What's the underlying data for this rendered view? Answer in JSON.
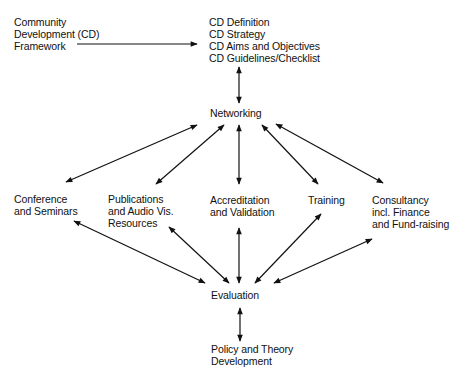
{
  "nodes": {
    "framework": {
      "lines": [
        "Community",
        "Development (CD)",
        "Framework"
      ]
    },
    "cd_block": {
      "lines": [
        "CD Definition",
        "CD Strategy",
        "CD Aims and Objectives",
        "CD Guidelines/Checklist"
      ]
    },
    "networking": {
      "lines": [
        "Networking"
      ]
    },
    "conference": {
      "lines": [
        "Conference",
        "and Seminars"
      ]
    },
    "publications": {
      "lines": [
        "Publications",
        "and Audio Vis.",
        "Resources"
      ]
    },
    "accreditation": {
      "lines": [
        "Accreditation",
        "and Validation"
      ]
    },
    "training": {
      "lines": [
        "Training"
      ]
    },
    "consultancy": {
      "lines": [
        "Consultancy",
        "incl. Finance",
        "and Fund-raising"
      ]
    },
    "evaluation": {
      "lines": [
        "Evaluation"
      ]
    },
    "policy": {
      "lines": [
        "Policy and Theory",
        "Development"
      ]
    }
  },
  "edges": [
    {
      "from": "framework",
      "to": "cd_block",
      "type": "single-arrow"
    },
    {
      "from": "cd_block",
      "to": "networking",
      "type": "double-arrow"
    },
    {
      "from": "networking",
      "to": "conference",
      "type": "double-arrow"
    },
    {
      "from": "networking",
      "to": "publications",
      "type": "double-arrow"
    },
    {
      "from": "networking",
      "to": "accreditation",
      "type": "double-arrow"
    },
    {
      "from": "networking",
      "to": "training",
      "type": "double-arrow"
    },
    {
      "from": "networking",
      "to": "consultancy",
      "type": "double-arrow"
    },
    {
      "from": "evaluation",
      "to": "conference",
      "type": "double-arrow"
    },
    {
      "from": "evaluation",
      "to": "publications",
      "type": "double-arrow"
    },
    {
      "from": "evaluation",
      "to": "accreditation",
      "type": "double-arrow"
    },
    {
      "from": "evaluation",
      "to": "training",
      "type": "double-arrow"
    },
    {
      "from": "evaluation",
      "to": "consultancy",
      "type": "double-arrow"
    },
    {
      "from": "evaluation",
      "to": "policy",
      "type": "double-arrow"
    }
  ]
}
